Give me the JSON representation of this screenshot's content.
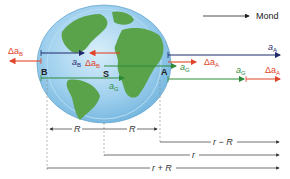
{
  "legend": {
    "label": "Mond",
    "arrow_color": "#222222"
  },
  "colors": {
    "navy": "#1f2a6b",
    "red": "#e0452b",
    "green": "#2e8b3a",
    "ocean": "#8ec5e8",
    "land": "#5aa34a",
    "dim": "#333333"
  },
  "points": {
    "B": "B",
    "S": "S",
    "A": "A"
  },
  "vectors": {
    "dA_B_left": {
      "sym": "Δa",
      "sub": "B"
    },
    "a_B": {
      "sym": "a",
      "sub": "B"
    },
    "dA_B_inner": {
      "sym": "Δa",
      "sub": "B"
    },
    "a_A": {
      "sym": "a",
      "sub": "A"
    },
    "dA_A_inner": {
      "sym": "Δa",
      "sub": "A"
    },
    "a_G_center": {
      "sym": "a",
      "sub": "G"
    },
    "a_G_A": {
      "sym": "a",
      "sub": "G"
    },
    "a_G_right": {
      "sym": "a",
      "sub": "G"
    },
    "dA_A_right": {
      "sym": "Δa",
      "sub": "A"
    }
  },
  "dimensions": {
    "R_left": "R",
    "R_right": "R",
    "r_minus_R": "r − R",
    "r": "r",
    "r_plus_R": "r + R"
  }
}
